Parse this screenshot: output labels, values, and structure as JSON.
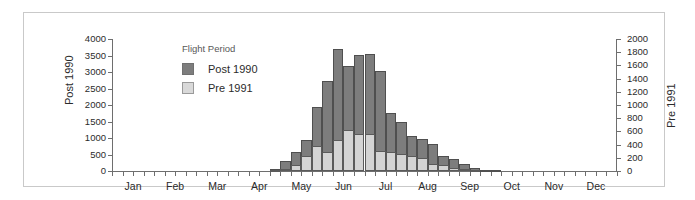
{
  "chart_data": {
    "type": "bar",
    "subtype": "stacked-overlay-dual-axis",
    "title": "",
    "xlabel": "",
    "ylabel": "Post 1990",
    "y2label": "Pre 1991",
    "grid": false,
    "ylim": [
      0,
      4000
    ],
    "y2lim": [
      0,
      2000
    ],
    "yticks": [
      0,
      500,
      1000,
      1500,
      2000,
      2500,
      3000,
      3500,
      4000
    ],
    "y2ticks": [
      0,
      200,
      400,
      600,
      800,
      1000,
      1200,
      1400,
      1600,
      1800,
      2000
    ],
    "xtick_labels": [
      "Jan",
      "Feb",
      "Mar",
      "Apr",
      "May",
      "Jun",
      "Jul",
      "Aug",
      "Sep",
      "Oct",
      "Nov",
      "Dec"
    ],
    "x_axis_note": "48 weekly bins across 12 months, 4 bins per month",
    "legend": {
      "title": "Flight Period",
      "position": "inside-top-left",
      "entries": [
        {
          "name": "Post 1990",
          "color": "#7d7d7d"
        },
        {
          "name": "Pre 1991",
          "color": "#d4d4d4"
        }
      ]
    },
    "series": [
      {
        "name": "Post 1990",
        "axis": "left",
        "values": [
          0,
          0,
          0,
          0,
          0,
          0,
          0,
          0,
          0,
          0,
          0,
          0,
          0,
          0,
          0,
          60,
          290,
          570,
          930,
          1940,
          2720,
          3710,
          3190,
          3510,
          3560,
          3020,
          1770,
          1500,
          1050,
          980,
          830,
          460,
          350,
          200,
          90,
          40,
          20,
          10,
          0,
          0,
          0,
          0,
          0,
          0,
          0,
          0,
          0,
          0
        ]
      },
      {
        "name": "Pre 1991",
        "axis": "right",
        "values": [
          0,
          0,
          0,
          0,
          0,
          0,
          0,
          0,
          0,
          0,
          0,
          0,
          0,
          0,
          0,
          10,
          30,
          90,
          220,
          380,
          290,
          475,
          620,
          555,
          560,
          300,
          295,
          260,
          225,
          200,
          100,
          95,
          45,
          30,
          10,
          5,
          0,
          0,
          0,
          0,
          0,
          0,
          0,
          0,
          0,
          0,
          0,
          0
        ]
      }
    ]
  }
}
